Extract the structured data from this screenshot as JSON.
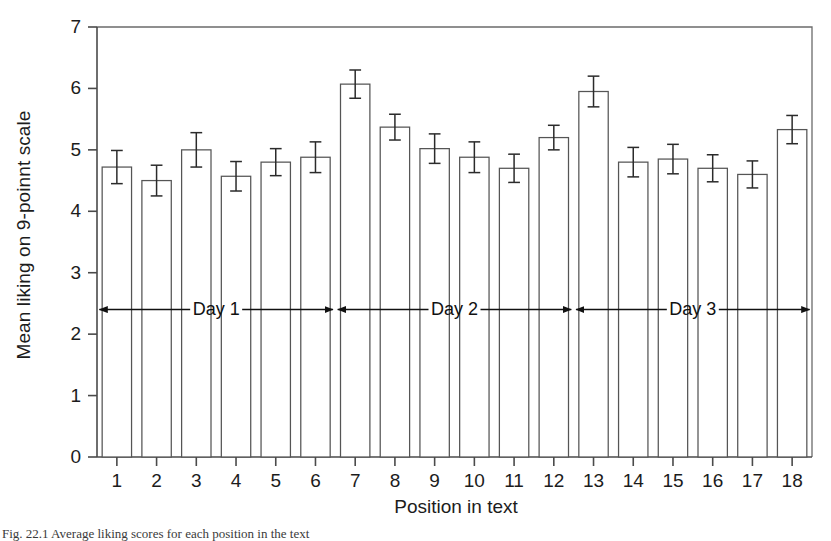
{
  "caption": {
    "text": "Fig. 22.1   Average liking scores for each position in the text"
  },
  "chart_data": {
    "type": "bar",
    "title": "",
    "xlabel": "Position in text",
    "ylabel": "Mean liking on 9-poinnt scale",
    "categories": [
      "1",
      "2",
      "3",
      "4",
      "5",
      "6",
      "7",
      "8",
      "9",
      "10",
      "11",
      "12",
      "13",
      "14",
      "15",
      "16",
      "17",
      "18"
    ],
    "values": [
      4.72,
      4.5,
      5.0,
      4.57,
      4.8,
      4.88,
      6.07,
      5.37,
      5.02,
      4.88,
      4.7,
      5.2,
      5.95,
      4.8,
      4.85,
      4.7,
      4.6,
      5.33
    ],
    "errors": [
      0.27,
      0.25,
      0.28,
      0.24,
      0.22,
      0.25,
      0.23,
      0.21,
      0.24,
      0.25,
      0.23,
      0.2,
      0.25,
      0.24,
      0.24,
      0.22,
      0.22,
      0.23
    ],
    "ylim": [
      0,
      7
    ],
    "yticks": [
      0,
      1,
      2,
      3,
      4,
      5,
      6,
      7
    ],
    "ytick_labels": [
      "0",
      "1",
      "2",
      "3",
      "4",
      "5",
      "6",
      "7"
    ],
    "grid": false,
    "legend": "none",
    "bar_fill": "#ffffff",
    "bar_edge": "#555555",
    "error_color": "#2b2b2b",
    "annotations": [
      {
        "label": "Day 1",
        "from_category": "1",
        "to_category": "6",
        "y_value": 2.4
      },
      {
        "label": "Day 2",
        "from_category": "7",
        "to_category": "12",
        "y_value": 2.4
      },
      {
        "label": "Day 3",
        "from_category": "13",
        "to_category": "18",
        "y_value": 2.4
      }
    ]
  }
}
